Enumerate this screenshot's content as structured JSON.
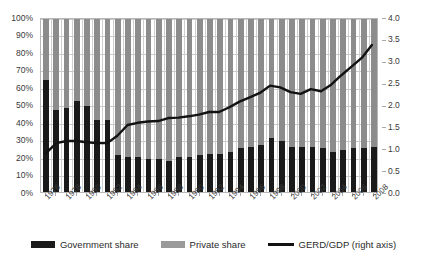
{
  "chart_data": {
    "type": "bar",
    "title": "",
    "xlabel": "",
    "ylabel": "",
    "ylabel_right": "",
    "grid": true,
    "legend_position": "bottom",
    "ylim": [
      0,
      100
    ],
    "ylim_right": [
      0,
      4.0
    ],
    "y_ticks": [
      "0%",
      "10%",
      "20%",
      "30%",
      "40%",
      "50%",
      "60%",
      "70%",
      "80%",
      "90%",
      "100%"
    ],
    "y_ticks_right": [
      "0.0",
      "0.5",
      "1.0",
      "1.5",
      "2.0",
      "2.5",
      "3.0",
      "3.5",
      "4.0"
    ],
    "categories": [
      "1976",
      "1977",
      "1978",
      "1979",
      "1980",
      "1981",
      "1982",
      "1983",
      "1984",
      "1985",
      "1986",
      "1987",
      "1988",
      "1989",
      "1990",
      "1991",
      "1992",
      "1993",
      "1994",
      "1995",
      "1996",
      "1997",
      "1998",
      "1999",
      "2000",
      "2001",
      "2002",
      "2003",
      "2004",
      "2005",
      "2006",
      "2007",
      "2008"
    ],
    "x_tick_labels": [
      "1976",
      "1978",
      "1980",
      "1982",
      "1984",
      "1986",
      "1988",
      "1990",
      "1992",
      "1994",
      "1996",
      "1998",
      "2000",
      "2002",
      "2004",
      "2006",
      "2008"
    ],
    "series": [
      {
        "name": "Government share",
        "axis": "left",
        "color": "#1a1a1a",
        "values": [
          64,
          47,
          48,
          52,
          49,
          41,
          41,
          21,
          20,
          20,
          19,
          19,
          18,
          20,
          20,
          21,
          22,
          22,
          23,
          25,
          26,
          27,
          31,
          29,
          26,
          26,
          26,
          25,
          23,
          24,
          25,
          25,
          26
        ]
      },
      {
        "name": "Private share",
        "axis": "left",
        "color": "#8c8c8c",
        "values": [
          36,
          53,
          52,
          48,
          51,
          59,
          59,
          79,
          80,
          80,
          81,
          81,
          82,
          80,
          80,
          79,
          78,
          78,
          77,
          75,
          74,
          73,
          69,
          71,
          74,
          74,
          74,
          75,
          77,
          76,
          75,
          75,
          74
        ]
      },
      {
        "name": "GERD/GDP (right axis)",
        "axis": "right",
        "type": "line",
        "color": "#121212",
        "values": [
          0.9,
          1.13,
          1.18,
          1.18,
          1.15,
          1.13,
          1.13,
          1.3,
          1.55,
          1.6,
          1.63,
          1.64,
          1.71,
          1.72,
          1.75,
          1.79,
          1.85,
          1.85,
          1.96,
          2.09,
          2.19,
          2.29,
          2.46,
          2.42,
          2.31,
          2.27,
          2.38,
          2.33,
          2.48,
          2.7,
          2.9,
          3.1,
          3.4
        ]
      }
    ]
  },
  "legend": {
    "items": [
      {
        "label": "Government share",
        "swatch": "gov"
      },
      {
        "label": "Private share",
        "swatch": "priv"
      },
      {
        "label": "GERD/GDP (right axis)",
        "swatch": "line"
      }
    ]
  }
}
